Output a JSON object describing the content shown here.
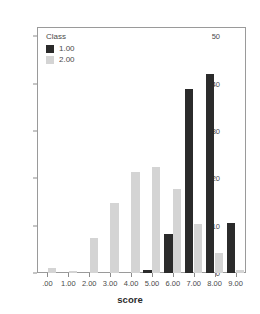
{
  "chart_data": {
    "type": "bar",
    "title": "",
    "xlabel": "score",
    "ylabel": "",
    "categories": [
      ".00",
      "1.00",
      "2.00",
      "3.00",
      "4.00",
      "5.00",
      "6.00",
      "7.00",
      "8.00",
      "9.00"
    ],
    "series": [
      {
        "name": "1.00",
        "color": "#2b2b2b",
        "values": [
          0,
          0,
          0,
          0,
          0,
          0.7,
          8.3,
          39,
          42,
          10.5
        ]
      },
      {
        "name": "2.00",
        "color": "#d4d4d4",
        "values": [
          1,
          0.5,
          7.5,
          14.8,
          21.3,
          22.4,
          17.7,
          10.3,
          4.2,
          0.6
        ]
      }
    ],
    "ylim": [
      0,
      52
    ],
    "yticks": [
      0,
      10,
      20,
      30,
      40,
      50
    ],
    "ytick_labels": [
      "0",
      "10",
      "20",
      "30",
      "40",
      "50"
    ],
    "grid": false,
    "legend": {
      "title": "Class",
      "position": "top-left",
      "entries": [
        {
          "label": "1.00",
          "color": "#2b2b2b"
        },
        {
          "label": "2.00",
          "color": "#d4d4d4"
        }
      ]
    }
  }
}
